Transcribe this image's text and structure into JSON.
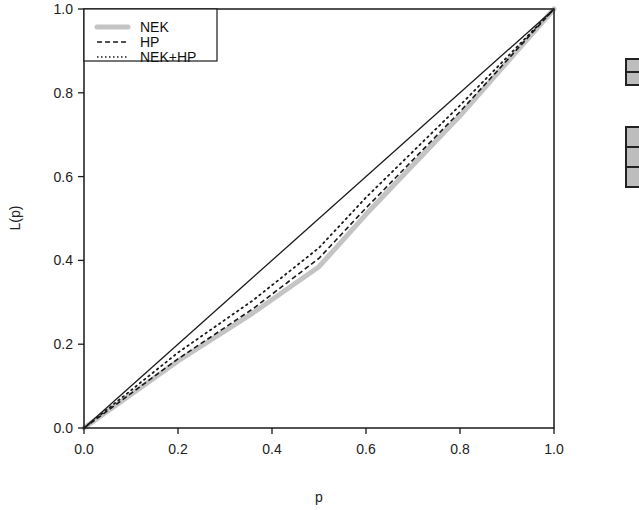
{
  "chart_data": {
    "type": "line",
    "title": "",
    "xlabel": "p",
    "ylabel": "L(p)",
    "xlim": [
      0.0,
      1.0
    ],
    "ylim": [
      0.0,
      1.0
    ],
    "grid": false,
    "legend_position": "upper-left",
    "x_ticks": [
      "0.0",
      "0.2",
      "0.4",
      "0.6",
      "0.8",
      "1.0"
    ],
    "y_ticks": [
      "0.0",
      "0.2",
      "0.4",
      "0.6",
      "0.8",
      "1.0"
    ],
    "series": [
      {
        "name": "Equality line",
        "style": "solid",
        "color": "#1a1a1a",
        "x": [
          0.0,
          1.0
        ],
        "y": [
          0.0,
          1.0
        ]
      },
      {
        "name": "NEK",
        "style": "thick-gray",
        "color": "#c4c4c4",
        "x": [
          0.0,
          0.2,
          0.36,
          0.5,
          0.6,
          0.8,
          1.0
        ],
        "y": [
          0.0,
          0.16,
          0.275,
          0.385,
          0.51,
          0.745,
          1.0
        ]
      },
      {
        "name": "HP",
        "style": "dashed",
        "color": "#1a1a1a",
        "x": [
          0.0,
          0.2,
          0.36,
          0.5,
          0.6,
          0.8,
          1.0
        ],
        "y": [
          0.0,
          0.165,
          0.285,
          0.405,
          0.525,
          0.755,
          1.0
        ]
      },
      {
        "name": "NEK+HP",
        "style": "dotted",
        "color": "#1a1a1a",
        "x": [
          0.0,
          0.2,
          0.36,
          0.5,
          0.6,
          0.8,
          1.0
        ],
        "y": [
          0.0,
          0.18,
          0.305,
          0.43,
          0.55,
          0.77,
          1.0
        ]
      }
    ]
  },
  "legend": {
    "items": [
      {
        "label": "NEK",
        "style": "thick-gray"
      },
      {
        "label": "HP",
        "style": "dashed"
      },
      {
        "label": "NEK+HP",
        "style": "dotted"
      }
    ]
  },
  "axes": {
    "xlabel": "p",
    "ylabel": "L(p)"
  },
  "side_widget": {
    "groups": [
      {
        "cells": 2
      },
      {
        "cells": 3
      }
    ]
  }
}
